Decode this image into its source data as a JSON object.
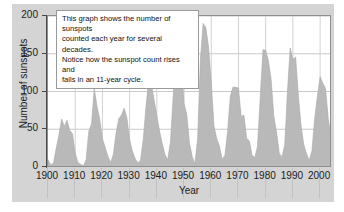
{
  "chart_data": {
    "type": "area",
    "title": "",
    "xlabel": "Year",
    "ylabel": "Number of sunspots",
    "xlim": [
      1900,
      2004
    ],
    "ylim": [
      0,
      200
    ],
    "ytick_labels": [
      "200",
      "150",
      "100",
      "50",
      "0"
    ],
    "yticks": [
      200,
      150,
      100,
      50,
      0
    ],
    "xtick_labels": [
      "1900",
      "1910",
      "1920",
      "1930",
      "1940",
      "1950",
      "1960",
      "1970",
      "1980",
      "1990",
      "2000"
    ],
    "xticks": [
      1900,
      1910,
      1920,
      1930,
      1940,
      1950,
      1960,
      1970,
      1980,
      1990,
      2000
    ],
    "grid": "horizontal-and-vertical",
    "legend": "none",
    "series_name": "Annual sunspot number",
    "fill_color": "#b9b9b9",
    "line_color": "#a8a8a8",
    "x": [
      1900,
      1901,
      1902,
      1903,
      1904,
      1905,
      1906,
      1907,
      1908,
      1909,
      1910,
      1911,
      1912,
      1913,
      1914,
      1915,
      1916,
      1917,
      1918,
      1919,
      1920,
      1921,
      1922,
      1923,
      1924,
      1925,
      1926,
      1927,
      1928,
      1929,
      1930,
      1931,
      1932,
      1933,
      1934,
      1935,
      1936,
      1937,
      1938,
      1939,
      1940,
      1941,
      1942,
      1943,
      1944,
      1945,
      1946,
      1947,
      1948,
      1949,
      1950,
      1951,
      1952,
      1953,
      1954,
      1955,
      1956,
      1957,
      1958,
      1959,
      1960,
      1961,
      1962,
      1963,
      1964,
      1965,
      1966,
      1967,
      1968,
      1969,
      1970,
      1971,
      1972,
      1973,
      1974,
      1975,
      1976,
      1977,
      1978,
      1979,
      1980,
      1981,
      1982,
      1983,
      1984,
      1985,
      1986,
      1987,
      1988,
      1989,
      1990,
      1991,
      1992,
      1993,
      1994,
      1995,
      1996,
      1997,
      1998,
      1999,
      2000,
      2001,
      2002,
      2003,
      2004
    ],
    "values": [
      9.5,
      2.7,
      5.0,
      24.4,
      42.0,
      63.5,
      53.8,
      62.0,
      48.5,
      43.9,
      18.6,
      5.7,
      3.6,
      1.4,
      9.6,
      47.4,
      57.1,
      103.9,
      80.6,
      63.6,
      37.6,
      26.1,
      14.2,
      5.8,
      16.7,
      44.3,
      63.9,
      69.0,
      77.8,
      64.9,
      35.7,
      21.2,
      11.1,
      5.7,
      8.7,
      36.1,
      79.7,
      114.4,
      109.6,
      88.8,
      67.8,
      47.5,
      30.6,
      16.3,
      9.6,
      33.2,
      92.6,
      151.6,
      136.3,
      134.7,
      83.9,
      69.4,
      31.5,
      13.9,
      4.4,
      38.0,
      141.7,
      190.2,
      184.8,
      159.0,
      112.3,
      53.9,
      37.6,
      27.9,
      10.2,
      15.1,
      47.0,
      93.8,
      105.9,
      105.5,
      104.5,
      66.6,
      68.9,
      38.0,
      34.5,
      15.5,
      12.6,
      27.5,
      92.5,
      155.4,
      154.6,
      140.5,
      115.9,
      66.6,
      45.9,
      17.9,
      13.4,
      29.4,
      100.2,
      157.6,
      142.6,
      145.7,
      94.3,
      54.6,
      29.9,
      17.5,
      8.6,
      21.5,
      64.3,
      93.3,
      119.6,
      111.0,
      104.0,
      63.7,
      40.4
    ]
  },
  "annotation": {
    "line1": "This graph shows the number of sunspots",
    "line2": "counted each year for several decades.",
    "line3": "Notice how the sunspot count rises and",
    "line4": "falls in an 11-year cycle."
  }
}
